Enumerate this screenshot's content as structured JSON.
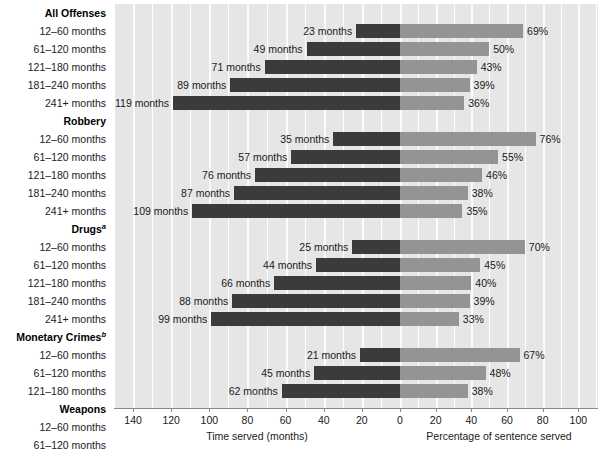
{
  "chart_data": {
    "type": "bar",
    "title": "",
    "subtitle": "",
    "orientation": "horizontal-diverging",
    "left_axis": {
      "label": "Time served (months)",
      "ticks": [
        140,
        120,
        100,
        80,
        60,
        40,
        20,
        0
      ],
      "range": [
        150,
        0
      ],
      "direction": "right-to-left"
    },
    "right_axis": {
      "label": "Percentage of sentence served",
      "ticks": [
        0,
        20,
        40,
        60,
        80,
        100
      ],
      "range": [
        0,
        111
      ],
      "direction": "left-to-right"
    },
    "series": [
      {
        "name": "Time served (months)",
        "color": "#3b3b3b",
        "side": "left"
      },
      {
        "name": "Percentage of sentence served",
        "color": "#949494",
        "side": "right"
      }
    ],
    "grid": "vertical-white-on-gray",
    "legend": "none",
    "groups": [
      {
        "name": "All Offenses",
        "footnote": "",
        "rows": [
          {
            "label": "12–60 months",
            "months": 23,
            "months_text": "23 months",
            "percent": 69,
            "percent_text": "69%"
          },
          {
            "label": "61–120 months",
            "months": 49,
            "months_text": "49 months",
            "percent": 50,
            "percent_text": "50%"
          },
          {
            "label": "121–180 months",
            "months": 71,
            "months_text": "71 months",
            "percent": 43,
            "percent_text": "43%"
          },
          {
            "label": "181–240 months",
            "months": 89,
            "months_text": "89 months",
            "percent": 39,
            "percent_text": "39%"
          },
          {
            "label": "241+ months",
            "months": 119,
            "months_text": "119 months",
            "percent": 36,
            "percent_text": "36%"
          }
        ]
      },
      {
        "name": "Robbery",
        "footnote": "",
        "rows": [
          {
            "label": "12–60 months",
            "months": 35,
            "months_text": "35 months",
            "percent": 76,
            "percent_text": "76%"
          },
          {
            "label": "61–120 months",
            "months": 57,
            "months_text": "57 months",
            "percent": 55,
            "percent_text": "55%"
          },
          {
            "label": "121–180 months",
            "months": 76,
            "months_text": "76 months",
            "percent": 46,
            "percent_text": "46%"
          },
          {
            "label": "181–240 months",
            "months": 87,
            "months_text": "87 months",
            "percent": 38,
            "percent_text": "38%"
          },
          {
            "label": "241+ months",
            "months": 109,
            "months_text": "109 months",
            "percent": 35,
            "percent_text": "35%"
          }
        ]
      },
      {
        "name": "Drugs",
        "footnote": "a",
        "rows": [
          {
            "label": "12–60 months",
            "months": 25,
            "months_text": "25 months",
            "percent": 70,
            "percent_text": "70%"
          },
          {
            "label": "61–120 months",
            "months": 44,
            "months_text": "44 months",
            "percent": 45,
            "percent_text": "45%"
          },
          {
            "label": "121–180 months",
            "months": 66,
            "months_text": "66 months",
            "percent": 40,
            "percent_text": "40%"
          },
          {
            "label": "181–240 months",
            "months": 88,
            "months_text": "88 months",
            "percent": 39,
            "percent_text": "39%"
          },
          {
            "label": "241+ months",
            "months": 99,
            "months_text": "99 months",
            "percent": 33,
            "percent_text": "33%"
          }
        ]
      },
      {
        "name": "Monetary Crimes",
        "footnote": "b",
        "rows": [
          {
            "label": "12–60 months",
            "months": 21,
            "months_text": "21 months",
            "percent": 67,
            "percent_text": "67%"
          },
          {
            "label": "61–120 months",
            "months": 45,
            "months_text": "45 months",
            "percent": 48,
            "percent_text": "48%"
          },
          {
            "label": "121–180 months",
            "months": 62,
            "months_text": "62 months",
            "percent": 38,
            "percent_text": "38%"
          }
        ]
      },
      {
        "name": "Weapons",
        "footnote": "",
        "rows": [
          {
            "label": "12–60 months",
            "months": 25,
            "months_text": "25 months",
            "percent": 74,
            "percent_text": "74%"
          },
          {
            "label": "61–120 months",
            "months": 48,
            "months_text": "48 months",
            "percent": 53,
            "percent_text": "53%"
          }
        ]
      }
    ],
    "colors": {
      "bar_left": "#3b3b3b",
      "bar_right": "#949494",
      "plot_background": "#e6e6e6",
      "gridline": "#ffffff",
      "axis": "#8a8a8a",
      "text": "#1a1a1a"
    }
  }
}
